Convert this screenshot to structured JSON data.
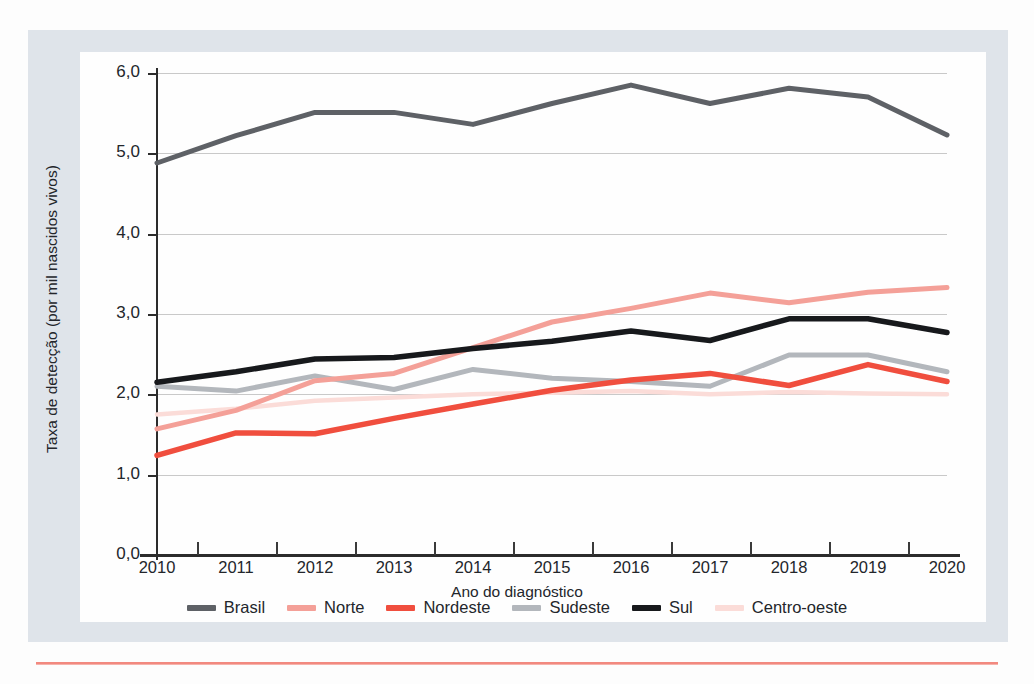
{
  "chart_data": {
    "type": "line",
    "title": "",
    "xlabel": "Ano do diagnóstico",
    "ylabel": "Taxa de detecção (por mil nascidos vivos)",
    "x": [
      2010,
      2011,
      2012,
      2013,
      2014,
      2015,
      2016,
      2017,
      2018,
      2019,
      2020
    ],
    "categories": [
      "2010",
      "2011",
      "2012",
      "2013",
      "2014",
      "2015",
      "2016",
      "2017",
      "2018",
      "2019",
      "2020"
    ],
    "ylim": [
      0.0,
      6.0
    ],
    "yticks": [
      "0,0",
      "1,0",
      "2,0",
      "3,0",
      "4,0",
      "5,0",
      "6,0"
    ],
    "ytick_values": [
      0.0,
      1.0,
      2.0,
      3.0,
      4.0,
      5.0,
      6.0
    ],
    "grid": true,
    "legend_position": "bottom",
    "series": [
      {
        "name": "Brasil",
        "color": "#5e6166",
        "values": [
          4.88,
          5.22,
          5.51,
          5.51,
          5.36,
          5.62,
          5.85,
          5.62,
          5.81,
          5.7,
          5.23
        ]
      },
      {
        "name": "Norte",
        "color": "#f4a098",
        "values": [
          1.57,
          1.8,
          2.17,
          2.26,
          2.58,
          2.9,
          3.07,
          3.26,
          3.14,
          3.27,
          3.33
        ]
      },
      {
        "name": "Nordeste",
        "color": "#f04e3e",
        "values": [
          1.24,
          1.52,
          1.51,
          1.7,
          1.88,
          2.05,
          2.18,
          2.26,
          2.11,
          2.37,
          2.16
        ]
      },
      {
        "name": "Sudeste",
        "color": "#b3b7bc",
        "values": [
          2.1,
          2.04,
          2.23,
          2.06,
          2.31,
          2.2,
          2.16,
          2.1,
          2.49,
          2.49,
          2.28
        ]
      },
      {
        "name": "Sul",
        "color": "#17191c",
        "values": [
          2.15,
          2.28,
          2.44,
          2.46,
          2.57,
          2.66,
          2.79,
          2.67,
          2.94,
          2.94,
          2.77
        ]
      },
      {
        "name": "Centro-oeste",
        "color": "#fbdcd8",
        "values": [
          1.75,
          1.82,
          1.92,
          1.96,
          2.0,
          2.02,
          2.04,
          2.0,
          2.03,
          2.01,
          2.0
        ]
      }
    ]
  },
  "axes": {
    "x_title": "Ano do diagnóstico",
    "y_title": "Taxa de detecção (por mil nascidos vivos)"
  },
  "colors": {
    "panel": "#dfe4ea",
    "plot_background": "#fefefe",
    "grid": "#c9c9c9",
    "axis": "#2c2c2c",
    "accent_rule": "#f2897f"
  }
}
